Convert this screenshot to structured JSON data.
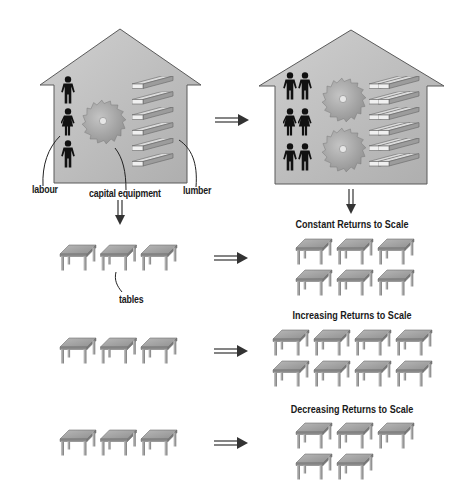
{
  "diagram": {
    "title": "Returns to Scale",
    "colors": {
      "house_fill_top": "#c9c9c9",
      "house_fill_bottom": "#b3b3b3",
      "house_stroke": "#555555",
      "person": "#111111",
      "saw": "#a8a8a8",
      "lumber_top": "#d8d8d8",
      "lumber_side": "#9a9a9a",
      "table_top": "#a5a5a5",
      "table_leg": "#8c8c8c",
      "arrow": "#333333"
    },
    "inputs_house": {
      "labels": {
        "labour": "labour",
        "capital": "capital equipment",
        "lumber": "lumber"
      },
      "workers": 3,
      "saws": 1,
      "lumber_boards": 6
    },
    "doubled_house": {
      "workers": 6,
      "saws": 2,
      "lumber_boards": 12
    },
    "output_label": "tables",
    "scenarios": [
      {
        "id": "constant",
        "title": "Constant Returns to Scale",
        "input_tables": 3,
        "output_tables": 6,
        "output_rows": [
          3,
          3
        ]
      },
      {
        "id": "increasing",
        "title": "Increasing Returns to Scale",
        "input_tables": 3,
        "output_tables": 8,
        "output_rows": [
          4,
          4
        ]
      },
      {
        "id": "decreasing",
        "title": "Decreasing Returns to Scale",
        "input_tables": 3,
        "output_tables": 5,
        "output_rows": [
          3,
          2
        ]
      }
    ],
    "arrows": {
      "right_symbol": "⇒",
      "down_symbol": "⇓"
    }
  }
}
